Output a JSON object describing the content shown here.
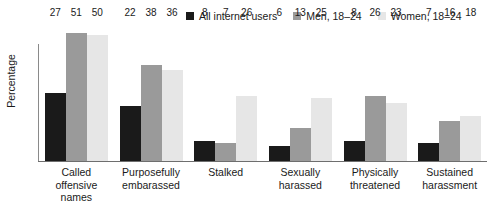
{
  "chart_data": {
    "type": "bar",
    "title": "",
    "xlabel": "",
    "ylabel": "Percentage",
    "ylim": [
      0,
      56
    ],
    "grid": false,
    "legend_position": "top-right",
    "categories": [
      "Called offensive names",
      "Purposefully embarassed",
      "Stalked",
      "Sexually harassed",
      "Physically threatened",
      "Sustained harassment"
    ],
    "series": [
      {
        "name": "All internet users",
        "color": "#1a1a1a",
        "values": [
          27,
          22,
          8,
          6,
          8,
          7
        ]
      },
      {
        "name": "Men, 18–24",
        "color": "#9a9a9a",
        "values": [
          51,
          38,
          7,
          13,
          26,
          16
        ]
      },
      {
        "name": "Women, 18–24",
        "color": "#e6e6e6",
        "values": [
          50,
          36,
          26,
          25,
          23,
          18
        ]
      }
    ]
  },
  "legend": {
    "items": [
      {
        "label": "All internet users",
        "color": "#1a1a1a"
      },
      {
        "label": "Men, 18–24",
        "color": "#9a9a9a"
      },
      {
        "label": "Women, 18–24",
        "color": "#e6e6e6"
      }
    ]
  },
  "axes": {
    "y_title": "Percentage"
  },
  "colors": {
    "axis": "#6e6e6e",
    "text": "#1a1a1a",
    "background": "#ffffff"
  }
}
